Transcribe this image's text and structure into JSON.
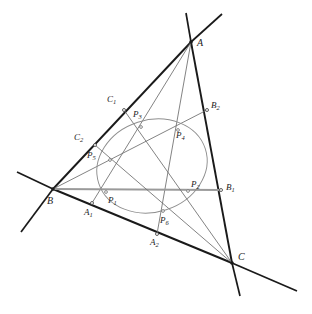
{
  "figure": {
    "type": "euclidean-geometry-diagram",
    "background": "#ffffff",
    "stroke_dark": "#1a1a1a",
    "stroke_mid": "#5a5a5a",
    "stroke_light": "#8f8f8f",
    "stroke_gray": "#9a9a9a",
    "width": 312,
    "height": 314
  },
  "vertices": [
    {
      "id": "A",
      "label": "A",
      "x": 191,
      "y": 42,
      "label_x": 197,
      "label_y": 38
    },
    {
      "id": "B",
      "label": "B",
      "x": 53,
      "y": 189,
      "label_x": 47,
      "label_y": 196
    },
    {
      "id": "C",
      "label": "C",
      "x": 232,
      "y": 263,
      "label_x": 238,
      "label_y": 252
    }
  ],
  "side_points": [
    {
      "id": "A1",
      "label": "A",
      "sub": "1",
      "x": 92,
      "y": 203,
      "label_x": 84,
      "label_y": 208
    },
    {
      "id": "A2",
      "label": "A",
      "sub": "2",
      "x": 157,
      "y": 234,
      "label_x": 150,
      "label_y": 238
    },
    {
      "id": "B1",
      "label": "B",
      "sub": "1",
      "x": 221,
      "y": 190,
      "label_x": 226,
      "label_y": 183
    },
    {
      "id": "B2",
      "label": "B",
      "sub": "2",
      "x": 207,
      "y": 110,
      "label_x": 211,
      "label_y": 101
    },
    {
      "id": "C1",
      "label": "C",
      "sub": "1",
      "x": 124,
      "y": 110,
      "label_x": 107,
      "label_y": 95
    },
    {
      "id": "C2",
      "label": "C",
      "sub": "2",
      "x": 95,
      "y": 145,
      "label_x": 74,
      "label_y": 133
    }
  ],
  "conic_points": [
    {
      "id": "P1",
      "label": "P",
      "sub": "1",
      "x": 106,
      "y": 192,
      "label_x": 108,
      "label_y": 196
    },
    {
      "id": "P2",
      "label": "P",
      "sub": "2",
      "x": 188,
      "y": 191,
      "label_x": 191,
      "label_y": 180
    },
    {
      "id": "P3",
      "label": "P",
      "sub": "3",
      "x": 141,
      "y": 127,
      "label_x": 133,
      "label_y": 110
    },
    {
      "id": "P4",
      "label": "P",
      "sub": "4",
      "x": 178,
      "y": 130,
      "label_x": 176,
      "label_y": 131
    },
    {
      "id": "P5",
      "label": "P",
      "sub": "5",
      "x": 110,
      "y": 160,
      "label_x": 87,
      "label_y": 151
    },
    {
      "id": "P6",
      "label": "P",
      "sub": "6",
      "x": 163,
      "y": 211,
      "label_x": 160,
      "label_y": 216
    }
  ],
  "extended_lines": {
    "beyond_A_left": {
      "x": 186,
      "y": 13
    },
    "beyond_A_right": {
      "x": 222,
      "y": 14
    },
    "beyond_B_up": {
      "x": 17,
      "y": 172
    },
    "beyond_B_down": {
      "x": 21,
      "y": 232
    },
    "beyond_C_right": {
      "x": 297,
      "y": 291
    },
    "beyond_C_down": {
      "x": 240,
      "y": 296
    }
  },
  "conic": {
    "type": "ellipse",
    "cx": 152,
    "cy": 166,
    "rx": 56,
    "ry": 46,
    "rotation_deg": -18
  },
  "segments": [
    {
      "name": "side-AB",
      "from": "A",
      "to": "B",
      "weight": "dark"
    },
    {
      "name": "side-BC",
      "from": "B",
      "to": "C",
      "weight": "dark"
    },
    {
      "name": "side-CA",
      "from": "C",
      "to": "A",
      "weight": "dark"
    },
    {
      "name": "cevian-B-B1",
      "from": "B",
      "to": "B1",
      "weight": "gray"
    },
    {
      "name": "cevian-A-A1",
      "from": "A",
      "to": "A1",
      "weight": "mid"
    },
    {
      "name": "cevian-A-A2",
      "from": "A",
      "to": "A2",
      "weight": "mid"
    },
    {
      "name": "cevian-B-B2",
      "from": "B",
      "to": "B2",
      "weight": "mid"
    },
    {
      "name": "cevian-C-C1",
      "from": "C",
      "to": "C1",
      "weight": "mid"
    },
    {
      "name": "cevian-C-C2",
      "from": "C",
      "to": "C2",
      "weight": "mid"
    }
  ]
}
